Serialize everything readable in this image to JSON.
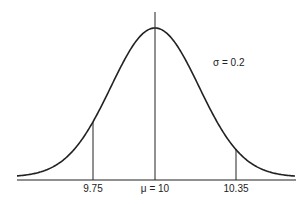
{
  "chart_data": {
    "type": "line",
    "title": "",
    "xlabel": "",
    "ylabel": "",
    "distribution": "normal",
    "mean": 10,
    "sigma": 0.2,
    "annotation": "σ = 0.2",
    "mean_label": "μ = 10",
    "markers": [
      {
        "x": 9.75,
        "label": "9.75"
      },
      {
        "x": 10,
        "label": "μ = 10"
      },
      {
        "x": 10.35,
        "label": "10.35"
      }
    ],
    "xlim": [
      9.44,
      10.6
    ],
    "grid": false,
    "legend": "none"
  },
  "labels": {
    "left_marker": "9.75",
    "mean": "μ = 10",
    "right_marker": "10.35",
    "sigma": "σ = 0.2"
  },
  "colors": {
    "ink": "#222222",
    "background": "#ffffff"
  }
}
